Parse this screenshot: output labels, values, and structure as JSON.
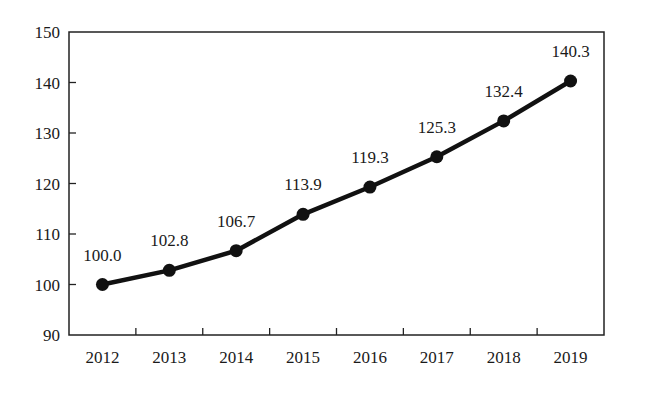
{
  "chart_data": {
    "type": "line",
    "title": "",
    "xlabel": "",
    "ylabel": "",
    "categories": [
      "2012",
      "2013",
      "2014",
      "2015",
      "2016",
      "2017",
      "2018",
      "2019"
    ],
    "series": [
      {
        "name": "Index",
        "values": [
          100.0,
          102.8,
          106.7,
          113.9,
          119.3,
          125.3,
          132.4,
          140.3
        ],
        "labels": [
          "100.0",
          "102.8",
          "106.7",
          "113.9",
          "119.3",
          "125.3",
          "132.4",
          "140.3"
        ],
        "color": "#111111",
        "marker": "circle"
      }
    ],
    "ylim": [
      90,
      150
    ],
    "yticks": [
      90,
      100,
      110,
      120,
      130,
      140,
      150
    ],
    "ytick_labels": [
      "90",
      "100",
      "110",
      "120",
      "130",
      "140",
      "150"
    ],
    "grid": false,
    "legend": null,
    "data_labels": true
  }
}
